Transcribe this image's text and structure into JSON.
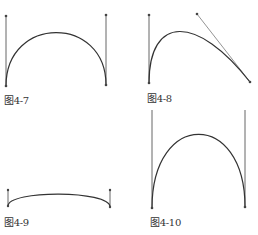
{
  "figures": [
    {
      "id": "fig-4-7",
      "caption": "图4-7"
    },
    {
      "id": "fig-4-8",
      "caption": "图4-8"
    },
    {
      "id": "fig-4-9",
      "caption": "图4-9"
    },
    {
      "id": "fig-4-10",
      "caption": "图4-10"
    }
  ],
  "colors": {
    "curve": "#333333",
    "handle": "#555555",
    "background": "#ffffff"
  }
}
